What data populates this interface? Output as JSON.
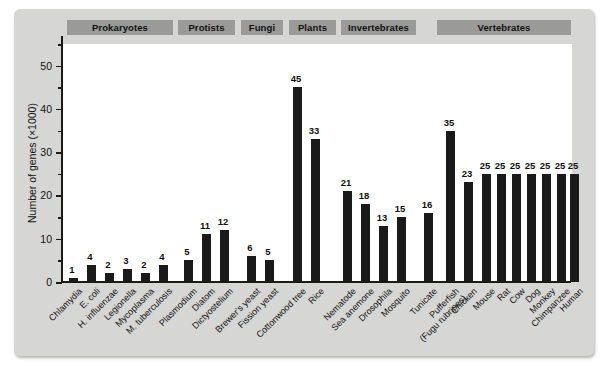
{
  "figure": {
    "background": "#d6d6d4",
    "bar_color": "#1a1a1a",
    "header_color": "#9a9a98"
  },
  "groups": [
    {
      "label": "Prokaryotes",
      "left": 67,
      "width": 106
    },
    {
      "label": "Protists",
      "left": 178,
      "width": 57
    },
    {
      "label": "Fungi",
      "left": 241,
      "width": 42
    },
    {
      "label": "Plants",
      "left": 289,
      "width": 47
    },
    {
      "label": "Invertebrates",
      "left": 341,
      "width": 75
    },
    {
      "label": "Vertebrates",
      "left": 437,
      "width": 134
    }
  ],
  "chart_data": {
    "type": "bar",
    "title": "",
    "xlabel": "",
    "ylabel": "Number of genes (×1000)",
    "ylim": [
      0,
      55
    ],
    "yticks": [
      0,
      10,
      20,
      30,
      40,
      50
    ],
    "yticks_minor": [
      5,
      15,
      25,
      35,
      45,
      55
    ],
    "grid": false,
    "legend": null,
    "categories": [
      "Chlamydia",
      "E. coli",
      "H. influenzae",
      "Legionella",
      "Mycoplasma",
      "M. tuberculosis",
      "Plasmodium",
      "Diatom",
      "Dictyostelium",
      "Brewer's yeast",
      "Fission yeast",
      "Cottonwood tree",
      "Rice",
      "Nematode",
      "Sea anemone",
      "Drosophila",
      "Mosquito",
      "Tunicate",
      "Pufferfish (Fugu rubripes)",
      "Chicken",
      "Mouse",
      "Rat",
      "Cow",
      "Dog",
      "Monkey",
      "Chimpanzee",
      "Human"
    ],
    "values": [
      1,
      4,
      2,
      3,
      2,
      4,
      5,
      11,
      12,
      6,
      5,
      45,
      33,
      21,
      18,
      13,
      15,
      16,
      35,
      23,
      25,
      25,
      25,
      25,
      25,
      25,
      25
    ],
    "group_of": [
      "Prokaryotes",
      "Prokaryotes",
      "Prokaryotes",
      "Prokaryotes",
      "Prokaryotes",
      "Prokaryotes",
      "Protists",
      "Protists",
      "Protists",
      "Fungi",
      "Fungi",
      "Plants",
      "Plants",
      "Invertebrates",
      "Invertebrates",
      "Invertebrates",
      "Invertebrates",
      "Vertebrates",
      "Vertebrates",
      "Vertebrates",
      "Vertebrates",
      "Vertebrates",
      "Vertebrates",
      "Vertebrates",
      "Vertebrates",
      "Vertebrates"
    ],
    "bar_centers": [
      72,
      90,
      108,
      126,
      144,
      162,
      187,
      205,
      223,
      250,
      268,
      296,
      314,
      346,
      364,
      382,
      400,
      427,
      449,
      467,
      485,
      500,
      515,
      530,
      545,
      560,
      573
    ],
    "label_lines": {
      "Pufferfish (Fugu rubripes)": [
        "Pufferfish",
        "(Fugu rubripes)"
      ]
    }
  }
}
